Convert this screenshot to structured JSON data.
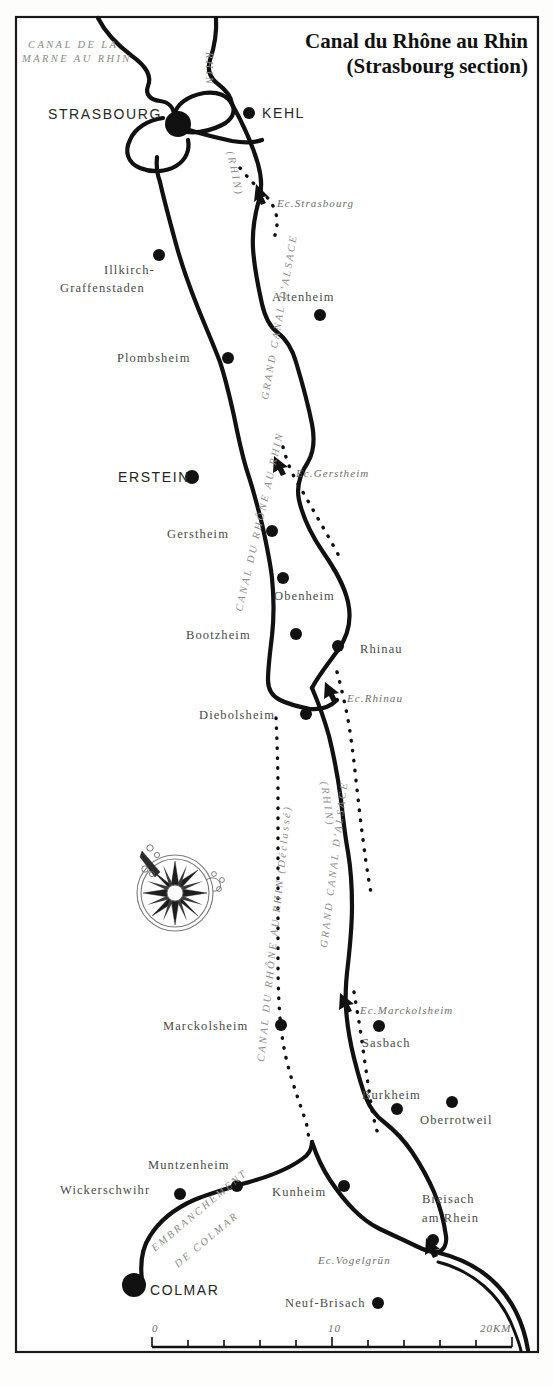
{
  "map": {
    "title_line1": "Canal du Rhône au Rhin",
    "title_line2": "(Strasbourg section)",
    "frame": {
      "x": 16,
      "y": 17,
      "width": 522,
      "height": 1335
    }
  },
  "cities": [
    {
      "name": "STRASBOURG",
      "label_x": 48,
      "label_y": 119,
      "dot_x": 178,
      "dot_y": 124,
      "dot_r": 13,
      "style": "major"
    },
    {
      "name": "KEHL",
      "label_x": 262,
      "label_y": 118,
      "dot_x": 249,
      "dot_y": 113,
      "dot_r": 6,
      "style": "major"
    },
    {
      "name": "Illkirch-",
      "label_x": 104,
      "label_y": 274,
      "dot_x": 159,
      "dot_y": 255,
      "dot_r": 6,
      "style": "minor"
    },
    {
      "name": "Graffenstaden",
      "label_x": 60,
      "label_y": 292,
      "dot_x": null,
      "dot_y": null,
      "dot_r": 0,
      "style": "minor"
    },
    {
      "name": "Altenheim",
      "label_x": 272,
      "label_y": 301,
      "dot_x": 320,
      "dot_y": 315,
      "dot_r": 6,
      "style": "minor"
    },
    {
      "name": "Plombsheim",
      "label_x": 117,
      "label_y": 362,
      "dot_x": 228,
      "dot_y": 358,
      "dot_r": 6,
      "style": "minor"
    },
    {
      "name": "ERSTEIN",
      "label_x": 118,
      "label_y": 482,
      "dot_x": 192,
      "dot_y": 477,
      "dot_r": 7,
      "style": "major"
    },
    {
      "name": "Gerstheim",
      "label_x": 167,
      "label_y": 538,
      "dot_x": 272,
      "dot_y": 531,
      "dot_r": 6,
      "style": "minor"
    },
    {
      "name": "Obenheim",
      "label_x": 274,
      "label_y": 600,
      "dot_x": 283,
      "dot_y": 578,
      "dot_r": 6,
      "style": "minor"
    },
    {
      "name": "Bootzheim",
      "label_x": 186,
      "label_y": 639,
      "dot_x": 296,
      "dot_y": 634,
      "dot_r": 6,
      "style": "minor"
    },
    {
      "name": "Rhinau",
      "label_x": 360,
      "label_y": 653,
      "dot_x": 338,
      "dot_y": 646,
      "dot_r": 6,
      "style": "minor"
    },
    {
      "name": "Diebolsheim",
      "label_x": 199,
      "label_y": 719,
      "dot_x": 306,
      "dot_y": 714,
      "dot_r": 6,
      "style": "minor"
    },
    {
      "name": "Marckolsheim",
      "label_x": 163,
      "label_y": 1030,
      "dot_x": 281,
      "dot_y": 1025,
      "dot_r": 6,
      "style": "minor"
    },
    {
      "name": "Sasbach",
      "label_x": 362,
      "label_y": 1047,
      "dot_x": 379,
      "dot_y": 1026,
      "dot_r": 6,
      "style": "minor"
    },
    {
      "name": "Burkheim",
      "label_x": 362,
      "label_y": 1099,
      "dot_x": 397,
      "dot_y": 1109,
      "dot_r": 6,
      "style": "minor"
    },
    {
      "name": "Oberrotweil",
      "label_x": 420,
      "label_y": 1124,
      "dot_x": 452,
      "dot_y": 1102,
      "dot_r": 6,
      "style": "minor"
    },
    {
      "name": "Muntzenheim",
      "label_x": 148,
      "label_y": 1169,
      "dot_x": 237,
      "dot_y": 1186,
      "dot_r": 6,
      "style": "minor"
    },
    {
      "name": "Wickerschwihr",
      "label_x": 60,
      "label_y": 1194,
      "dot_x": 180,
      "dot_y": 1194,
      "dot_r": 6,
      "style": "minor"
    },
    {
      "name": "Kunheim",
      "label_x": 272,
      "label_y": 1196,
      "dot_x": 344,
      "dot_y": 1186,
      "dot_r": 6,
      "style": "minor"
    },
    {
      "name": "Breisach",
      "label_x": 422,
      "label_y": 1203,
      "dot_x": 433,
      "dot_y": 1240,
      "dot_r": 6,
      "style": "minor"
    },
    {
      "name": "am Rhein",
      "label_x": 422,
      "label_y": 1222,
      "dot_x": null,
      "dot_y": null,
      "dot_r": 0,
      "style": "minor"
    },
    {
      "name": "COLMAR",
      "label_x": 150,
      "label_y": 1295,
      "dot_x": 134,
      "dot_y": 1285,
      "dot_r": 12,
      "style": "major"
    },
    {
      "name": "Neuf-Brisach",
      "label_x": 285,
      "label_y": 1307,
      "dot_x": 378,
      "dot_y": 1303,
      "dot_r": 6,
      "style": "minor"
    }
  ],
  "locks": [
    {
      "name": "Ec.Strasbourg",
      "label_x": 277,
      "label_y": 207,
      "arrow_x": 263,
      "arrow_y": 196
    },
    {
      "name": "Ec.Gerstheim",
      "label_x": 296,
      "label_y": 477,
      "arrow_x": 283,
      "arrow_y": 466
    },
    {
      "name": "Ec.Rhinau",
      "label_x": 347,
      "label_y": 702,
      "arrow_x": 334,
      "arrow_y": 692
    },
    {
      "name": "Ec.Marckolsheim",
      "label_x": 360,
      "label_y": 1014,
      "arrow_x": 348,
      "arrow_y": 1003
    },
    {
      "name": "Ec.Vogelgrün",
      "label_x": 318,
      "label_y": 1264,
      "arrow_x": 432,
      "arrow_y": 1249
    }
  ],
  "canal_labels": [
    {
      "name": "CANAL DE LA",
      "x": 28,
      "y": 48,
      "rotate": 0,
      "size": 10.5
    },
    {
      "name": "MARNE AU RHIN",
      "x": 22,
      "y": 62,
      "rotate": 0,
      "size": 10.5
    },
    {
      "name": "RHIN",
      "x": 206,
      "y": 52,
      "rotate": 90,
      "size": 10.5
    },
    {
      "name": "(RHIN)",
      "x": 227,
      "y": 152,
      "rotate": 78,
      "size": 10.5
    },
    {
      "name": "GRAND CANAL D'ALSACE",
      "x": 268,
      "y": 400,
      "rotate": -80,
      "size": 10.5
    },
    {
      "name": "CANAL DU RHÔNE AU RHIN",
      "x": 242,
      "y": 612,
      "rotate": -77,
      "size": 10.5
    },
    {
      "name": "(RHIN)",
      "x": 321,
      "y": 782,
      "rotate": 82,
      "size": 10.5
    },
    {
      "name": "GRAND CANAL D'ALSACE",
      "x": 327,
      "y": 948,
      "rotate": -83,
      "size": 10.5
    },
    {
      "name": "CANAL DU RHÔNE AU RHIN (Déclassé)",
      "x": 264,
      "y": 1062,
      "rotate": -84,
      "size": 10.5
    },
    {
      "name": "EMBRANCHEMENT",
      "x": 155,
      "y": 1252,
      "rotate": -40,
      "size": 10.5
    },
    {
      "name": "DE COLMAR",
      "x": 178,
      "y": 1268,
      "rotate": -40,
      "size": 10.5
    }
  ],
  "scale": {
    "labels": [
      {
        "text": "0",
        "x": 152,
        "y": 1332
      },
      {
        "text": "10",
        "x": 328,
        "y": 1332
      },
      {
        "text": "20KM",
        "x": 480,
        "y": 1332
      }
    ],
    "bar": {
      "x1": 152,
      "x2": 512,
      "y": 1347
    },
    "ticks": [
      152,
      188,
      224,
      260,
      296,
      332,
      368,
      404,
      440,
      476,
      512
    ]
  },
  "compass": {
    "name": "compass-rose",
    "cx": 175,
    "cy": 893,
    "r": 38
  },
  "colors": {
    "ink": "#111111",
    "paper": "#ffffff",
    "muted_label": "#8a8a8a",
    "city_label": "#4a4a4a"
  }
}
